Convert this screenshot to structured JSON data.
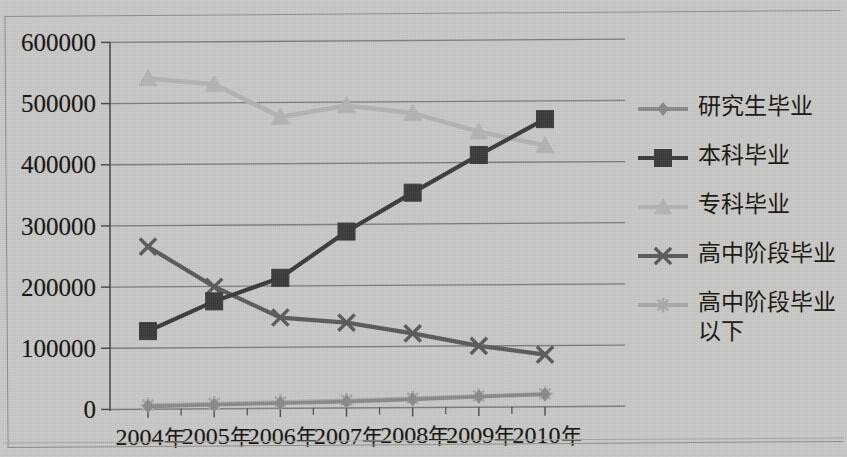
{
  "chart_data": {
    "type": "line",
    "title": "",
    "xlabel": "",
    "ylabel": "",
    "categories": [
      "2004年",
      "2005年",
      "2006年",
      "2007年",
      "2008年",
      "2009年",
      "2010年"
    ],
    "ylim": [
      0,
      600000
    ],
    "ytick_values": [
      0,
      100000,
      200000,
      300000,
      400000,
      500000,
      600000
    ],
    "ytick_labels": [
      "0",
      "100000",
      "200000",
      "300000",
      "400000",
      "500000",
      "600000"
    ],
    "grid": true,
    "legend_position": "right",
    "series": [
      {
        "name": "研究生毕业",
        "marker": "diamond",
        "color": "#8a8a88",
        "values": [
          4000,
          6000,
          8000,
          10000,
          13000,
          17000,
          20000
        ]
      },
      {
        "name": "本科毕业",
        "marker": "square",
        "color": "#3a3a38",
        "values": [
          127000,
          175000,
          213000,
          288000,
          351000,
          412000,
          470000
        ]
      },
      {
        "name": "专科毕业",
        "marker": "triangle",
        "color": "#b4b4b2",
        "values": [
          540000,
          530000,
          476000,
          494000,
          481000,
          450000,
          427000
        ]
      },
      {
        "name": "高中阶段毕业",
        "marker": "x",
        "color": "#5a5a58",
        "values": [
          265000,
          199000,
          148000,
          139000,
          121000,
          100000,
          85000
        ]
      },
      {
        "name": "高中阶段毕业以下",
        "marker": "star",
        "color": "#a9a9a7",
        "values": [
          6000,
          8000,
          10000,
          12000,
          15000,
          18000,
          21000
        ]
      }
    ]
  },
  "legend": {
    "items": [
      {
        "label": "研究生毕业",
        "marker": "diamond",
        "color": "#8a8a88"
      },
      {
        "label": "本科毕业",
        "marker": "square",
        "color": "#3a3a38"
      },
      {
        "label": "专科毕业",
        "marker": "triangle",
        "color": "#b4b4b2"
      },
      {
        "label": "高中阶段毕业",
        "marker": "x",
        "color": "#5a5a58"
      },
      {
        "label": "高中阶段毕业\n以下",
        "marker": "star",
        "color": "#a9a9a7"
      }
    ]
  },
  "axis": {
    "y_labels": [
      "600000",
      "500000",
      "400000",
      "300000",
      "200000",
      "100000",
      "0"
    ],
    "x_labels": [
      "2004年",
      "2005年",
      "2006年",
      "2007年",
      "2008年",
      "2009年",
      "2010年"
    ]
  },
  "colors": {
    "background": "#c9c9c7",
    "gridline": "#6f6f6d",
    "axis": "#4a4a48",
    "text": "#15130f"
  }
}
